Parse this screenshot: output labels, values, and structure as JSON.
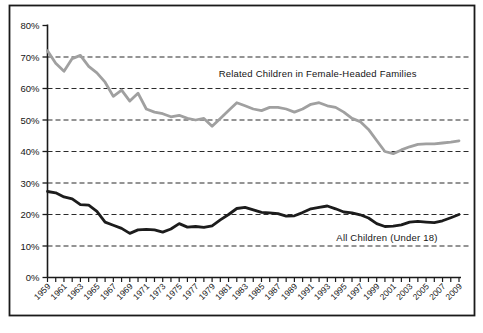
{
  "frame": {
    "background": "#ffffff",
    "border_color": "#1a1a1a"
  },
  "chart_data": {
    "type": "line",
    "title": "",
    "xlabel": "",
    "ylabel": "",
    "x_range": [
      1959,
      2009
    ],
    "ylim": [
      0,
      80
    ],
    "grid": "horizontal dashed lines at 10% through 70%",
    "legend_position": "none (direct line labels inside plot)",
    "y_tick_labels": [
      "0%",
      "10%",
      "20%",
      "30%",
      "40%",
      "50%",
      "60%",
      "70%",
      "80%"
    ],
    "x_label_years": [
      "1959",
      "1961",
      "1963",
      "1965",
      "1967",
      "1969",
      "1971",
      "1973",
      "1975",
      "1977",
      "1979",
      "1981",
      "1983",
      "1985",
      "1987",
      "1989",
      "1991",
      "1993",
      "1995",
      "1997",
      "1999",
      "2001",
      "2003",
      "2005",
      "2007",
      "2009"
    ],
    "series": [
      {
        "name": "Related Children in Female-Headed Families",
        "color": "#a0a0a0",
        "values": [
          72,
          68,
          65.5,
          69.5,
          70.5,
          67,
          65,
          62,
          57.5,
          59.5,
          56,
          58.5,
          53.5,
          52.5,
          52,
          51,
          51.5,
          50.5,
          50,
          50.5,
          48,
          50.5,
          53,
          55.5,
          54.5,
          53.5,
          53,
          54,
          54,
          53.5,
          52.5,
          53.5,
          55,
          55.5,
          54.5,
          54,
          52.5,
          50.5,
          49.5,
          47,
          43.5,
          40,
          39.3,
          40.5,
          41.5,
          42.3,
          42.4,
          42.4,
          42.7,
          43,
          43.4
        ]
      },
      {
        "name": "All Children (Under 18)",
        "color": "#1c1c1c",
        "values": [
          27.3,
          26.9,
          25.6,
          25.0,
          23.1,
          23.0,
          21.0,
          17.6,
          16.6,
          15.6,
          14.0,
          15.1,
          15.3,
          15.1,
          14.4,
          15.4,
          17.1,
          16.0,
          16.2,
          15.9,
          16.4,
          18.3,
          20.0,
          21.9,
          22.3,
          21.5,
          20.7,
          20.5,
          20.3,
          19.5,
          19.6,
          20.6,
          21.8,
          22.3,
          22.7,
          21.8,
          20.8,
          20.5,
          19.9,
          18.9,
          17.1,
          16.2,
          16.3,
          16.7,
          17.6,
          17.8,
          17.6,
          17.4,
          18.0,
          19.0,
          20.0
        ]
      }
    ],
    "annotations": [
      {
        "text": "Related Children in Female-Headed Families",
        "x_year": 1979.8,
        "y_value": 64.5
      },
      {
        "text": "All Children (Under 18)",
        "x_year": 1994.1,
        "y_value": 12.6
      }
    ]
  }
}
